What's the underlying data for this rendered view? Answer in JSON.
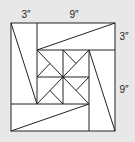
{
  "diagram": {
    "colors": {
      "background": "#e8e8e8",
      "fill": "#ffffff",
      "stroke": "#222222"
    },
    "labels": [
      {
        "id": "top-left-width",
        "text": "3″",
        "x": 26,
        "y": 15
      },
      {
        "id": "top-right-width",
        "text": "9″",
        "x": 74,
        "y": 15
      },
      {
        "id": "right-top-height",
        "text": "3″",
        "x": 124,
        "y": 37
      },
      {
        "id": "right-bottom-height",
        "text": "9″",
        "x": 124,
        "y": 90
      }
    ],
    "outer_square": {
      "x": 11,
      "y": 23,
      "w": 104,
      "h": 108
    },
    "lines": [
      {
        "name": "left-strip-divider",
        "x1": 37,
        "y1": 23,
        "x2": 37,
        "y2": 104
      },
      {
        "name": "top-strip-divider",
        "x1": 37,
        "y1": 50,
        "x2": 115,
        "y2": 50
      },
      {
        "name": "right-strip-divider",
        "x1": 89,
        "y1": 50,
        "x2": 89,
        "y2": 131
      },
      {
        "name": "bottom-strip-divider",
        "x1": 11,
        "y1": 104,
        "x2": 89,
        "y2": 104
      },
      {
        "name": "left-strip-diagonal",
        "x1": 11,
        "y1": 23,
        "x2": 37,
        "y2": 104
      },
      {
        "name": "top-strip-diagonal",
        "x1": 37,
        "y1": 50,
        "x2": 115,
        "y2": 23
      },
      {
        "name": "right-strip-diagonal",
        "x1": 89,
        "y1": 50,
        "x2": 115,
        "y2": 131
      },
      {
        "name": "bottom-strip-diagonal",
        "x1": 11,
        "y1": 131,
        "x2": 89,
        "y2": 104
      },
      {
        "name": "center-vertical",
        "x1": 63,
        "y1": 50,
        "x2": 63,
        "y2": 104
      },
      {
        "name": "center-horizontal",
        "x1": 37,
        "y1": 77,
        "x2": 89,
        "y2": 77
      },
      {
        "name": "center-diagonal-a",
        "x1": 37,
        "y1": 50,
        "x2": 89,
        "y2": 104
      },
      {
        "name": "center-diagonal-b",
        "x1": 89,
        "y1": 50,
        "x2": 37,
        "y2": 104
      },
      {
        "name": "pinwheel-tl",
        "x1": 37,
        "y1": 77,
        "x2": 50,
        "y2": 63.5
      },
      {
        "name": "pinwheel-tr",
        "x1": 63,
        "y1": 50,
        "x2": 76,
        "y2": 63.5
      },
      {
        "name": "pinwheel-br",
        "x1": 89,
        "y1": 77,
        "x2": 76,
        "y2": 90.5
      },
      {
        "name": "pinwheel-bl",
        "x1": 63,
        "y1": 104,
        "x2": 50,
        "y2": 90.5
      }
    ],
    "center_dot": {
      "cx": 63,
      "cy": 77,
      "r": 1.3
    }
  }
}
